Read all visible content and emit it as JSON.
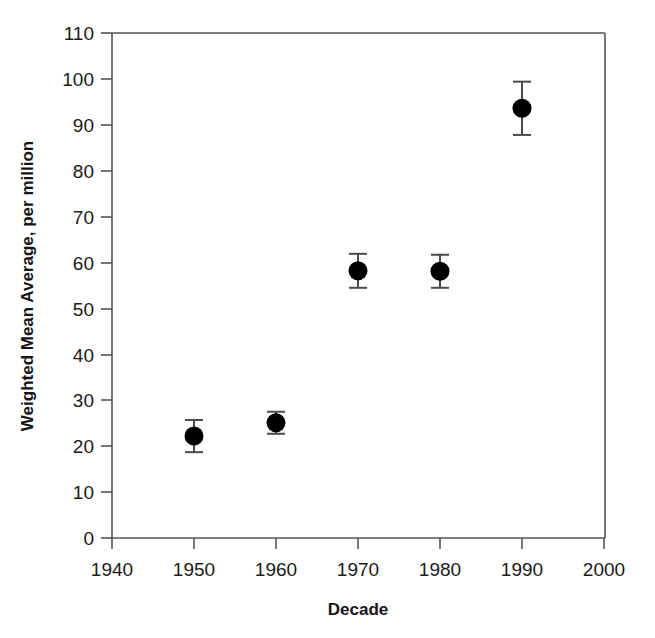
{
  "chart_data": {
    "type": "scatter",
    "title": "",
    "subtitle": "",
    "xlabel": "Decade",
    "ylabel": "Weighted Mean Average, per million",
    "xlim": [
      1940,
      2000
    ],
    "ylim": [
      0,
      110
    ],
    "xticks": [
      1940,
      1950,
      1960,
      1970,
      1980,
      1990,
      2000
    ],
    "xtick_labels": [
      "1940",
      "1950",
      "1960",
      "1970",
      "1980",
      "1990",
      "2000"
    ],
    "yticks": [
      0,
      10,
      20,
      30,
      40,
      50,
      60,
      70,
      80,
      90,
      100,
      110
    ],
    "ytick_labels": [
      "0",
      "10",
      "20",
      "30",
      "40",
      "50",
      "60",
      "70",
      "80",
      "90",
      "100",
      "110"
    ],
    "grid": false,
    "legend": false,
    "legend_position": "none",
    "marker": "filled-circle",
    "marker_color": "#000000",
    "errorbar_color": "#4a4a4a",
    "errorbars": true,
    "x": [
      1950,
      1960,
      1970,
      1980,
      1990
    ],
    "y": [
      22.2,
      25.1,
      58.2,
      58.1,
      93.6
    ],
    "yerr": [
      3.5,
      2.4,
      3.7,
      3.6,
      5.8
    ],
    "points": [
      {
        "x": 1950,
        "y": 22.2,
        "yerr": 3.5,
        "ylow": 18.7,
        "yhigh": 25.7
      },
      {
        "x": 1960,
        "y": 25.1,
        "yerr": 2.4,
        "ylow": 22.7,
        "yhigh": 27.5
      },
      {
        "x": 1970,
        "y": 58.2,
        "yerr": 3.7,
        "ylow": 54.5,
        "yhigh": 61.9
      },
      {
        "x": 1980,
        "y": 58.1,
        "yerr": 3.6,
        "ylow": 54.5,
        "yhigh": 61.7
      },
      {
        "x": 1990,
        "y": 93.6,
        "yerr": 5.8,
        "ylow": 87.8,
        "yhigh": 99.4
      }
    ],
    "annotations": []
  },
  "axes": {
    "ylabel": "Weighted Mean Average, per million",
    "xlabel": "Decade"
  },
  "colors": {
    "background": "#ffffff",
    "axis": "#555555",
    "marker": "#000000",
    "errorbar": "#4a4a4a",
    "text": "#1a1a1a"
  }
}
